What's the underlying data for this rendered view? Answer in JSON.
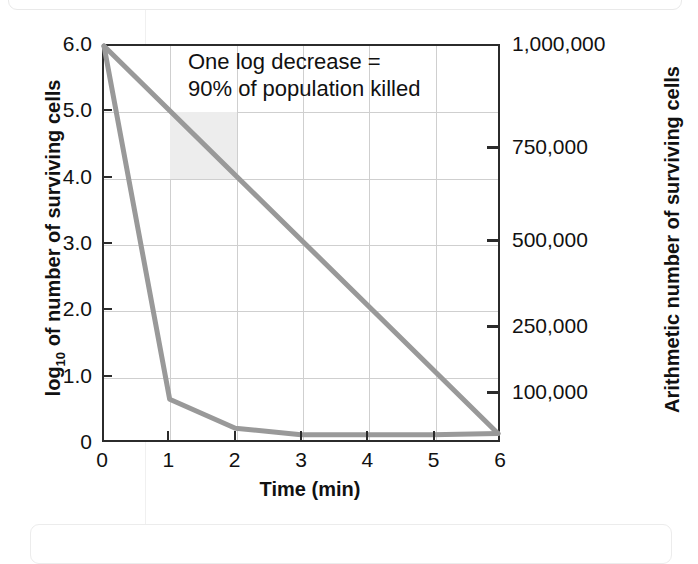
{
  "chart_data": {
    "type": "line",
    "title": "",
    "xlabel": "Time (min)",
    "ylabel": "log10 of number of surviving cells",
    "ylabel_right": "Arithmetic number of surviving cells",
    "xlim": [
      0,
      6
    ],
    "ylim": [
      0,
      6
    ],
    "grid": true,
    "legend_position": "none",
    "x_ticks": [
      "0",
      "1",
      "2",
      "3",
      "4",
      "5",
      "6"
    ],
    "x_tick_values": [
      0,
      1,
      2,
      3,
      4,
      5,
      6
    ],
    "y_ticks_left": [
      "0",
      "1.0",
      "2.0",
      "3.0",
      "4.0",
      "5.0",
      "6.0"
    ],
    "y_tick_values_left": [
      0,
      1,
      2,
      3,
      4,
      5,
      6
    ],
    "y_ticks_right": [
      "100,000",
      "250,000",
      "500,000",
      "750,000",
      "1,000,000"
    ],
    "y_tick_values_right": [
      0.75,
      1.75,
      3.05,
      4.45,
      6.0
    ],
    "annotations": [
      {
        "name": "one-log-decrease-note",
        "line1": "One log decrease =",
        "line2": "90% of population killed"
      }
    ],
    "shaded_regions": [
      {
        "name": "one-log-shade",
        "x0": 1,
        "x1": 2,
        "y0": 4.0,
        "y1": 5.0,
        "color": "#ededed"
      }
    ],
    "series": [
      {
        "name": "logarithmic-death-line",
        "color": "#999999",
        "x": [
          0,
          6
        ],
        "values": [
          6.0,
          0.1
        ]
      },
      {
        "name": "arithmetic-death-curve",
        "color": "#999999",
        "x": [
          0,
          1,
          2,
          3,
          4,
          5,
          6
        ],
        "values": [
          6.0,
          0.62,
          0.18,
          0.08,
          0.08,
          0.08,
          0.1
        ]
      }
    ]
  },
  "axes": {
    "left_title_pre": "log",
    "left_title_sub": "10",
    "left_title_post": " of number of surviving cells",
    "right_title": "Arithmetic number of surviving cells",
    "bottom_title": "Time (min)"
  },
  "page_artifacts": {
    "top_text": "(100 min) minutes of killing time",
    "top_box_label": "page-top-callout-box",
    "bottom_box_label": "page-bottom-callout-box"
  }
}
